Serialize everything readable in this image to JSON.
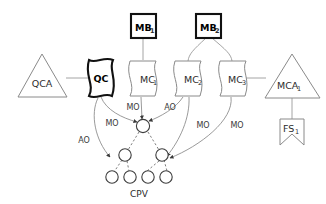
{
  "diagram": {
    "colors": {
      "bold_stroke": "#111111",
      "thin_stroke": "#8a8a8a",
      "connector": "#9a9a9a",
      "tree_node": "#3d3d3d",
      "background": "#ffffff"
    },
    "nodes": [
      {
        "id": "qca",
        "label": "QCA",
        "sub": "",
        "shape": "triangle",
        "emphasis": "thin"
      },
      {
        "id": "qc",
        "label": "QC",
        "sub": "",
        "shape": "wave-doc",
        "emphasis": "bold"
      },
      {
        "id": "mc1",
        "label": "MC",
        "sub": "1",
        "shape": "wave-doc",
        "emphasis": "thin"
      },
      {
        "id": "mc2",
        "label": "MC",
        "sub": "2",
        "shape": "wave-doc",
        "emphasis": "thin"
      },
      {
        "id": "mc3",
        "label": "MC",
        "sub": "3",
        "shape": "wave-doc",
        "emphasis": "thin"
      },
      {
        "id": "mca1",
        "label": "MCA",
        "sub": "1",
        "shape": "triangle",
        "emphasis": "thin"
      },
      {
        "id": "mb1",
        "label": "MB",
        "sub": "1",
        "shape": "square",
        "emphasis": "bold"
      },
      {
        "id": "mb2",
        "label": "MB",
        "sub": "2",
        "shape": "square",
        "emphasis": "bold"
      },
      {
        "id": "fs1",
        "label": "FS",
        "sub": "1",
        "shape": "banner",
        "emphasis": "thin"
      }
    ],
    "edge_labels": [
      {
        "id": "ao-qc",
        "text": "AO"
      },
      {
        "id": "mo-qc",
        "text": "MO"
      },
      {
        "id": "mo-mc1",
        "text": "MO"
      },
      {
        "id": "ao-mc2",
        "text": "AO"
      },
      {
        "id": "mo-mc2",
        "text": "MO"
      },
      {
        "id": "mo-mc3",
        "text": "MO"
      }
    ],
    "tree": {
      "caption": "CPV",
      "levels": [
        {
          "name": "root",
          "count": 1
        },
        {
          "name": "middle",
          "count": 2
        },
        {
          "name": "leaves",
          "count": 4
        }
      ]
    }
  }
}
